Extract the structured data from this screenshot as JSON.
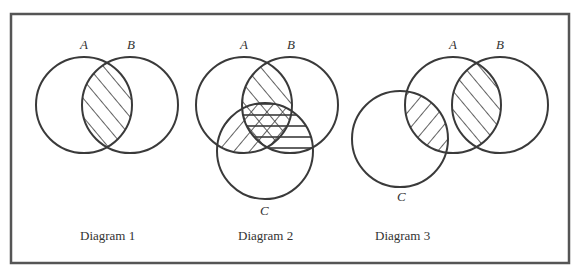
{
  "frame": {
    "stroke": "#555555"
  },
  "colors": {
    "line": "#3a3a3a",
    "background": "#ffffff"
  },
  "diagrams": [
    {
      "caption": "Diagram 1",
      "sets": [
        {
          "label": "A",
          "cx": 84,
          "cy": 105,
          "r": 48
        },
        {
          "label": "B",
          "cx": 130,
          "cy": 105,
          "r": 48
        }
      ],
      "shaded": [
        "A∩B"
      ]
    },
    {
      "caption": "Diagram 2",
      "sets": [
        {
          "label": "A",
          "cx": 244,
          "cy": 105,
          "r": 48
        },
        {
          "label": "B",
          "cx": 290,
          "cy": 105,
          "r": 48
        },
        {
          "label": "C",
          "cx": 265,
          "cy": 151,
          "r": 48
        }
      ],
      "shaded": [
        "A∩B (diagonal /)",
        "A∩C (diagonal \\)",
        "B∩C (horizontal)",
        "A∩B∩C (cross-hatched)"
      ]
    },
    {
      "caption": "Diagram 3",
      "sets": [
        {
          "label": "A",
          "cx": 453,
          "cy": 105,
          "r": 48
        },
        {
          "label": "B",
          "cx": 500,
          "cy": 105,
          "r": 48
        },
        {
          "label": "C",
          "cx": 400,
          "cy": 139,
          "r": 48
        }
      ],
      "shaded": [
        "A∩B (diagonal /)",
        "A∩C (diagonal \\)"
      ]
    }
  ]
}
